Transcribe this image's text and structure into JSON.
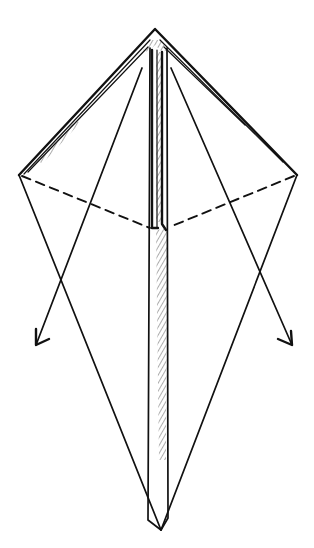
{
  "diagram": {
    "type": "origami-fold-step",
    "colors": {
      "ink": "#111111",
      "background": "#ffffff",
      "hatch": "#333333"
    },
    "points": {
      "top_apex": [
        155,
        30
      ],
      "left_corner": [
        19,
        175
      ],
      "right_corner": [
        297,
        175
      ],
      "bottom_apex": [
        161,
        530
      ],
      "center_fold": [
        155,
        228
      ]
    },
    "fold_lines": [
      {
        "kind": "valley",
        "style": "dashed",
        "from": "left_corner",
        "to": "center_fold"
      },
      {
        "kind": "valley",
        "style": "dashed",
        "from": "right_corner",
        "to": "center_fold"
      }
    ],
    "arrows": [
      {
        "name": "left-fold-arrow",
        "from": [
          142,
          68
        ],
        "to": [
          36,
          345
        ],
        "direction": "down-left"
      },
      {
        "name": "right-fold-arrow",
        "from": [
          171,
          68
        ],
        "to": [
          292,
          345
        ],
        "direction": "down-right"
      }
    ],
    "labels": []
  }
}
